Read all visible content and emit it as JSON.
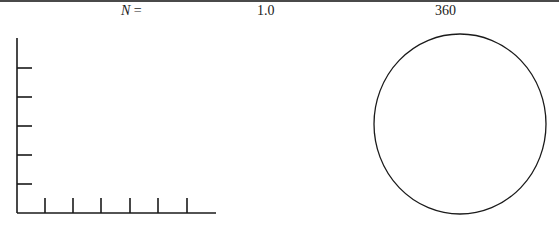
{
  "header": {
    "n_symbol": "N",
    "equals": " =",
    "value_1": "1.0",
    "value_2": "360"
  },
  "axes": {
    "y_ticks": 5,
    "x_ticks": 6
  },
  "circle": {
    "shape": "circle"
  },
  "colors": {
    "stroke": "#1a1a1a",
    "background": "#ffffff"
  }
}
